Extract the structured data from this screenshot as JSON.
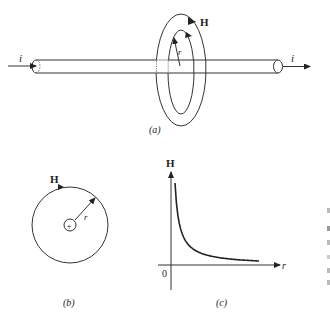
{
  "figure_a": {
    "caption": "(a)",
    "current_in_label": "i",
    "current_out_label": "i",
    "field_label": "H",
    "radius_label": "r"
  },
  "figure_b": {
    "caption": "(b)",
    "field_label": "H",
    "radius_label": "r",
    "center_symbol": "+"
  },
  "figure_c": {
    "caption": "(c)",
    "y_axis_label": "H",
    "x_axis_label": "r",
    "origin_label": "0"
  },
  "chart_data": {
    "type": "line",
    "title": "",
    "xlabel": "r",
    "ylabel": "H",
    "relation": "H proportional to 1/r",
    "x": [
      0.05,
      0.1,
      0.2,
      0.3,
      0.5,
      0.7,
      1.0
    ],
    "series": [
      {
        "name": "H(r)",
        "values": [
          20,
          10,
          5,
          3.33,
          2,
          1.43,
          1
        ]
      }
    ],
    "origin_label": "0",
    "ticks": "none",
    "grid": false
  }
}
